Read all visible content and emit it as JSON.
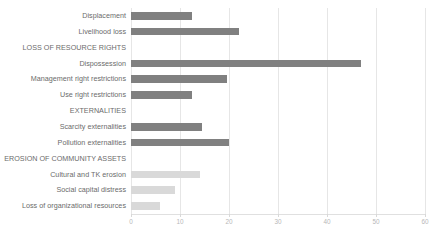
{
  "chart_data": {
    "type": "bar",
    "orientation": "horizontal",
    "title": "",
    "subtitle": "",
    "xlabel": "",
    "ylabel": "",
    "xlim": [
      0,
      60
    ],
    "xticks": [
      0,
      10,
      20,
      30,
      40,
      50,
      60
    ],
    "xtick_labels": [
      "0",
      "10",
      "20",
      "30",
      "40",
      "50",
      "60"
    ],
    "grid": true,
    "grid_axis": "x",
    "legend": false,
    "legend_position": "none",
    "colors": {
      "bar_dark": "#808080",
      "bar_light": "#d9d9d9",
      "gridline": "#e6e6e6",
      "label_text": "#6b6b6b",
      "tick_text": "#b8b8b8",
      "background": "#ffffff"
    },
    "categories": [
      "Displacement",
      "Livelihood loss",
      "LOSS OF RESOURCE RIGHTS",
      "Dispossession",
      "Management right restrictions",
      "Use right restrictions",
      "EXTERNALITIES",
      "Scarcity externalities",
      "Pollution externalities",
      "EROSION OF COMMUNITY ASSETS",
      "Cultural and TK erosion",
      "Social capital distress",
      "Loss of organizational resources"
    ],
    "values": [
      12.5,
      22,
      null,
      47,
      19.5,
      12.5,
      null,
      14.5,
      20,
      null,
      14,
      9,
      6
    ],
    "rows": [
      {
        "label": "Displacement",
        "value": 12.5,
        "is_header": false,
        "shade": "dark"
      },
      {
        "label": "Livelihood loss",
        "value": 22,
        "is_header": false,
        "shade": "dark"
      },
      {
        "label": "LOSS OF RESOURCE RIGHTS",
        "value": null,
        "is_header": true,
        "shade": "none"
      },
      {
        "label": "Dispossession",
        "value": 47,
        "is_header": false,
        "shade": "dark"
      },
      {
        "label": "Management right restrictions",
        "value": 19.5,
        "is_header": false,
        "shade": "dark"
      },
      {
        "label": "Use right restrictions",
        "value": 12.5,
        "is_header": false,
        "shade": "dark"
      },
      {
        "label": "EXTERNALITIES",
        "value": null,
        "is_header": true,
        "shade": "none"
      },
      {
        "label": "Scarcity externalities",
        "value": 14.5,
        "is_header": false,
        "shade": "dark"
      },
      {
        "label": "Pollution externalities",
        "value": 20,
        "is_header": false,
        "shade": "dark"
      },
      {
        "label": "EROSION OF COMMUNITY ASSETS",
        "value": null,
        "is_header": true,
        "shade": "none"
      },
      {
        "label": "Cultural and TK erosion",
        "value": 14,
        "is_header": false,
        "shade": "light"
      },
      {
        "label": "Social capital distress",
        "value": 9,
        "is_header": false,
        "shade": "light"
      },
      {
        "label": "Loss of organizational resources",
        "value": 6,
        "is_header": false,
        "shade": "light"
      }
    ]
  }
}
